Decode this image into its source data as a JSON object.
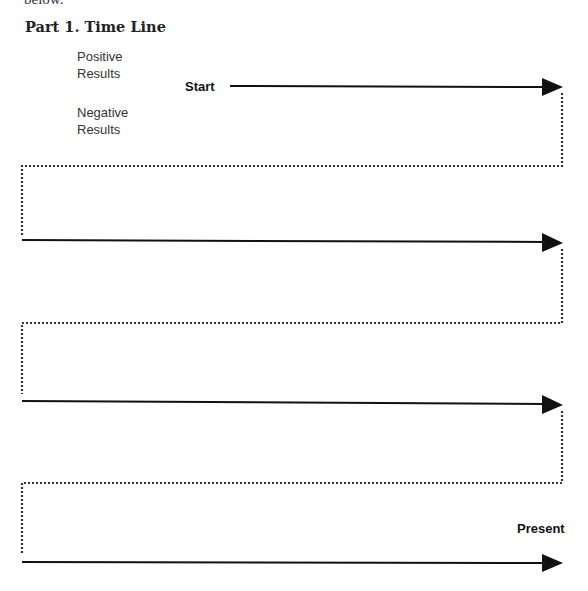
{
  "header": {
    "cut_text": "below.",
    "title": "Part 1. Time Line"
  },
  "legend": {
    "positive": [
      "Positive",
      "Results"
    ],
    "negative": [
      "Negative",
      "Results"
    ]
  },
  "timeline": {
    "start_label": "Start",
    "end_label": "Present",
    "rows": 4,
    "solid_color": "#111111",
    "dotted_color": "#333333"
  }
}
